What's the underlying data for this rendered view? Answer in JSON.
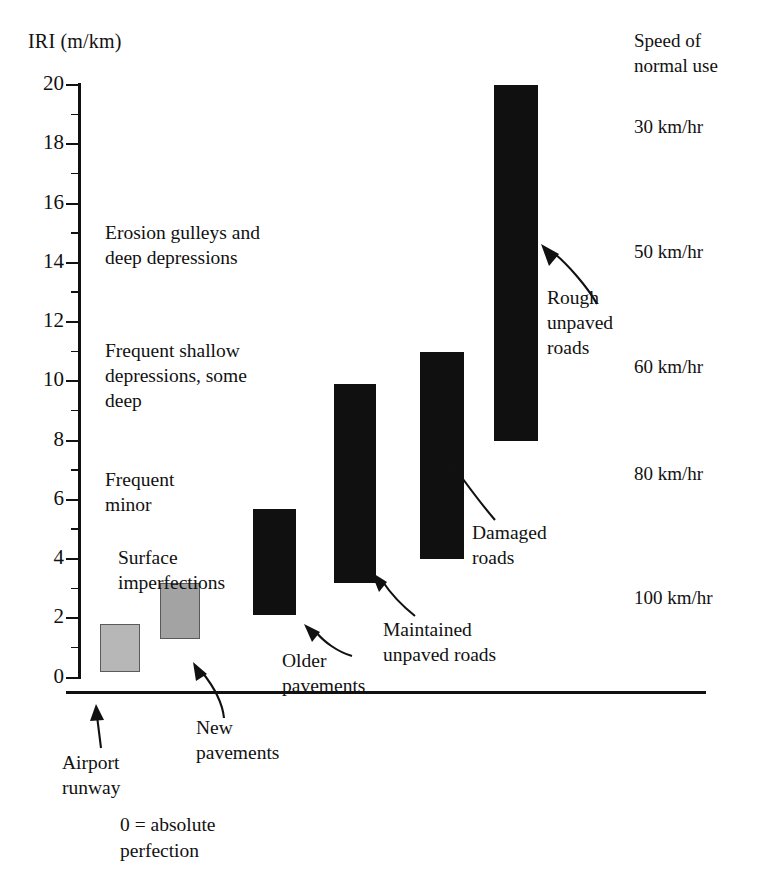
{
  "chart_data": {
    "type": "bar",
    "title": "IRI (m/km)",
    "ylabel": "IRI (m/km)",
    "xlabel": "",
    "ylim": [
      0,
      20
    ],
    "ytick_labels": [
      "0",
      "2",
      "4",
      "6",
      "8",
      "10",
      "12",
      "14",
      "16",
      "18",
      "20"
    ],
    "ytick_values": [
      0,
      2,
      4,
      6,
      8,
      10,
      12,
      14,
      16,
      18,
      20
    ],
    "minor_tick_step": 1,
    "grid": false,
    "legend": "none",
    "orientation": "vertical",
    "note": "Floating range bars: each bar spans a low-high IRI roughness interval for a road class.",
    "categories": [
      "Airport runway",
      "New pavements",
      "Older pavements",
      "Maintained unpaved roads",
      "Damaged roads",
      "Rough unpaved roads"
    ],
    "bars": [
      {
        "label": "Airport runway",
        "low": 0.2,
        "high": 1.8,
        "color": "#b7b7b7",
        "style": "gray-light"
      },
      {
        "label": "New pavements",
        "low": 1.3,
        "high": 3.2,
        "color": "#a3a3a3",
        "style": "gray-mid"
      },
      {
        "label": "Older pavements",
        "low": 2.1,
        "high": 5.7,
        "color": "#101010",
        "style": "dark"
      },
      {
        "label": "Maintained unpaved roads",
        "low": 3.2,
        "high": 9.9,
        "color": "#101010",
        "style": "dark"
      },
      {
        "label": "Damaged roads",
        "low": 4.0,
        "high": 11.0,
        "color": "#101010",
        "style": "dark"
      },
      {
        "label": "Rough unpaved roads",
        "low": 8.0,
        "high": 20.0,
        "color": "#101010",
        "style": "dark"
      }
    ],
    "condition_descriptions": [
      {
        "text": "Erosion gulleys and deep depressions",
        "approx_iri": 15
      },
      {
        "text": "Frequent shallow depressions, some deep",
        "approx_iri": 10.5
      },
      {
        "text": "Frequent minor",
        "approx_iri": 6
      },
      {
        "text": "Surface imperfections",
        "approx_iri": 4
      }
    ],
    "speed_of_normal_use": [
      {
        "speed": "30 km/hr",
        "approx_iri": 18.5
      },
      {
        "speed": "50 km/hr",
        "approx_iri": 14.3
      },
      {
        "speed": "60 km/hr",
        "approx_iri": 10.4
      },
      {
        "speed": "80 km/hr",
        "approx_iri": 6.8
      },
      {
        "speed": "100 km/hr",
        "approx_iri": 2.6
      }
    ]
  },
  "axis": {
    "y_title": "IRI (m/km)",
    "ticks": [
      "20",
      "18",
      "16",
      "14",
      "12",
      "10",
      "8",
      "6",
      "4",
      "2",
      "0"
    ]
  },
  "speed_panel": {
    "header_line1": "Speed of",
    "header_line2": "normal use",
    "items": [
      "30 km/hr",
      "50 km/hr",
      "60 km/hr",
      "80 km/hr",
      "100 km/hr"
    ]
  },
  "descriptions": {
    "erosion_line1": "Erosion gulleys and",
    "erosion_line2": "deep depressions",
    "shallow_line1": "Frequent shallow",
    "shallow_line2": "depressions, some",
    "shallow_line3": "deep",
    "minor_line1": "Frequent",
    "minor_line2": "minor",
    "surface_line1": "Surface",
    "surface_line2": "imperfections"
  },
  "callouts": {
    "airport_line1": "Airport",
    "airport_line2": "runway",
    "new_line1": "New",
    "new_line2": "pavements",
    "older_line1": "Older",
    "older_line2": "pavements",
    "maintained_line1": "Maintained",
    "maintained_line2": "unpaved roads",
    "damaged_line1": "Damaged",
    "damaged_line2": "roads",
    "rough_line1": "Rough",
    "rough_line2": "unpaved",
    "rough_line3": "roads"
  },
  "footnote": {
    "line1": "0 = absolute",
    "line2": "perfection"
  }
}
